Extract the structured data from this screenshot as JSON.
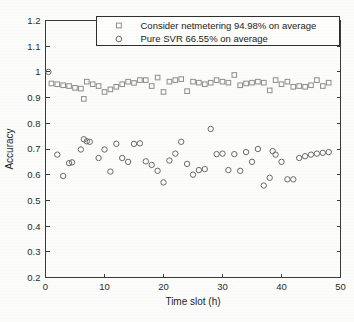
{
  "chart_data": {
    "type": "scatter",
    "title": "",
    "xlabel": "Time slot (h)",
    "ylabel": "Accuracy",
    "xlim": [
      0,
      50
    ],
    "ylim": [
      0.2,
      1.2
    ],
    "xticks": [
      0,
      10,
      20,
      30,
      40,
      50
    ],
    "xtick_labels": [
      "0",
      "10",
      "20",
      "30",
      "40",
      "50"
    ],
    "yticks": [
      0.2,
      0.3,
      0.4,
      0.5,
      0.6,
      0.7,
      0.8,
      0.9,
      1.0,
      1.1,
      1.2
    ],
    "ytick_labels": [
      "0.2",
      "0.3",
      "0.4",
      "0.5",
      "0.6",
      "0.7",
      "0.8",
      "0.9",
      "1",
      "1.1",
      "1.2"
    ],
    "grid": false,
    "legend_position": "upper center",
    "series": [
      {
        "name": "Consider netmetering 94.98% on average",
        "marker": "square",
        "color": "#8d8d8d",
        "x": [
          1,
          2,
          3,
          4,
          5,
          6,
          6.5,
          7,
          8,
          9,
          10,
          11,
          12,
          13,
          14,
          15,
          16,
          17,
          18,
          19,
          20,
          21,
          22,
          23,
          24,
          25,
          26,
          27,
          28,
          29,
          30,
          31,
          32,
          33,
          34,
          35,
          36,
          37,
          38,
          39,
          40,
          41,
          42,
          43,
          44,
          45,
          46,
          47,
          48
        ],
        "y": [
          0.955,
          0.952,
          0.948,
          0.945,
          0.938,
          0.935,
          0.895,
          0.962,
          0.952,
          0.945,
          0.922,
          0.932,
          0.942,
          0.952,
          0.962,
          0.957,
          0.968,
          0.968,
          0.945,
          0.978,
          0.922,
          0.962,
          0.968,
          0.972,
          0.925,
          0.962,
          0.958,
          0.952,
          0.958,
          0.968,
          0.962,
          0.958,
          0.988,
          0.948,
          0.955,
          0.958,
          0.962,
          0.958,
          0.928,
          0.968,
          0.952,
          0.962,
          0.942,
          0.945,
          0.942,
          0.948,
          0.968,
          0.945,
          0.958
        ]
      },
      {
        "name": "Pure SVR 66.55% on average",
        "marker": "circle",
        "color": "#6a6a6a",
        "x": [
          0.5,
          2,
          3,
          4,
          4.5,
          6,
          6.5,
          7,
          7.5,
          9,
          10,
          11,
          12,
          13,
          14,
          15,
          16,
          17,
          18,
          19,
          20,
          21,
          22,
          23,
          24,
          25,
          26,
          27,
          28,
          29,
          30,
          31,
          32,
          33,
          34,
          35,
          36,
          37,
          38,
          38.5,
          39,
          40,
          41,
          42,
          43,
          44,
          45,
          46,
          47,
          48
        ],
        "y": [
          1.0,
          0.678,
          0.595,
          0.645,
          0.648,
          0.698,
          0.738,
          0.73,
          0.728,
          0.665,
          0.698,
          0.612,
          0.72,
          0.665,
          0.65,
          0.72,
          0.722,
          0.652,
          0.638,
          0.615,
          0.57,
          0.655,
          0.682,
          0.728,
          0.642,
          0.6,
          0.618,
          0.622,
          0.778,
          0.68,
          0.682,
          0.618,
          0.68,
          0.615,
          0.688,
          0.65,
          0.7,
          0.558,
          0.588,
          0.692,
          0.678,
          0.65,
          0.582,
          0.582,
          0.665,
          0.672,
          0.678,
          0.682,
          0.685,
          0.688
        ]
      }
    ]
  },
  "legend": {
    "entries": [
      {
        "label": "Consider netmetering 94.98% on average",
        "marker": "square"
      },
      {
        "label": "Pure SVR 66.55% on average",
        "marker": "circle"
      }
    ]
  }
}
